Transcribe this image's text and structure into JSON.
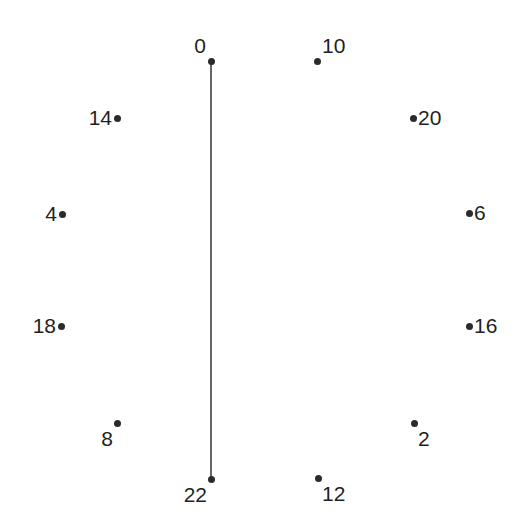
{
  "figure": {
    "background_color": "#ffffff",
    "width": 529,
    "height": 530
  },
  "chart_data": {
    "type": "scatter",
    "title": "",
    "xlabel": "",
    "ylabel": "",
    "xlim": [
      0,
      529
    ],
    "ylim": [
      530,
      0
    ],
    "grid": false,
    "legend": null,
    "axes_visible": false,
    "node_color": "#2b2b2b",
    "node_size_px": 7,
    "label_color": "#1f1f1f",
    "label_font_size_px": 21,
    "edge_color": "#333333",
    "edge_width_px": 1.5,
    "nodes": [
      {
        "label": "0",
        "x": 211,
        "y": 61,
        "label_pos": "above-left"
      },
      {
        "label": "10",
        "x": 317,
        "y": 61,
        "label_pos": "above-right"
      },
      {
        "label": "14",
        "x": 117,
        "y": 118,
        "label_pos": "left"
      },
      {
        "label": "20",
        "x": 413,
        "y": 118,
        "label_pos": "right"
      },
      {
        "label": "4",
        "x": 62,
        "y": 214,
        "label_pos": "left"
      },
      {
        "label": "6",
        "x": 469,
        "y": 213,
        "label_pos": "right"
      },
      {
        "label": "18",
        "x": 61,
        "y": 326,
        "label_pos": "left"
      },
      {
        "label": "16",
        "x": 469,
        "y": 326,
        "label_pos": "right"
      },
      {
        "label": "8",
        "x": 117,
        "y": 423,
        "label_pos": "below-left"
      },
      {
        "label": "2",
        "x": 414,
        "y": 423,
        "label_pos": "below-right"
      },
      {
        "label": "22",
        "x": 211,
        "y": 479,
        "label_pos": "below-left"
      },
      {
        "label": "12",
        "x": 318,
        "y": 478,
        "label_pos": "below-right"
      }
    ],
    "edges": [
      {
        "source": "0",
        "target": "22",
        "x1": 211,
        "y1": 61,
        "x2": 211,
        "y2": 479
      }
    ]
  }
}
